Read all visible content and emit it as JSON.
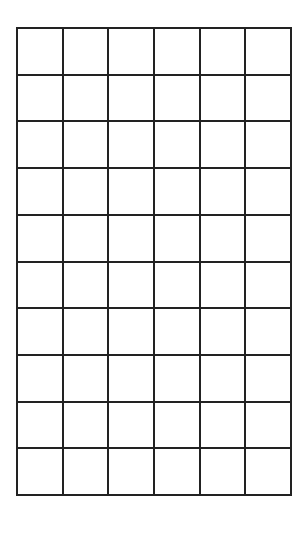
{
  "grid": {
    "rows": 10,
    "columns": 6,
    "line_color": "#222222",
    "background": "#ffffff",
    "cells_filled": []
  }
}
